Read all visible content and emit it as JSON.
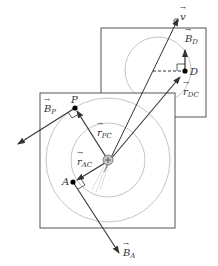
{
  "diagram": {
    "type": "rigid-body-rotation-velocity-diagram",
    "colors": {
      "stroke": "#333333",
      "circle": "#b0b0b0",
      "square": "#555555",
      "point": "#000000",
      "center_fill": "#c8c8c8"
    },
    "labels": {
      "v": "v",
      "B_D": "B",
      "B_D_sub": "D",
      "D": "D",
      "r_DC": "r",
      "r_DC_sub": "DC",
      "P": "P",
      "B_P": "B",
      "B_P_sub": "P",
      "r_PC": "r",
      "r_PC_sub": "PC",
      "r_AC": "r",
      "r_AC_sub": "AC",
      "A": "A",
      "B_A": "B",
      "B_A_sub": "A"
    }
  }
}
